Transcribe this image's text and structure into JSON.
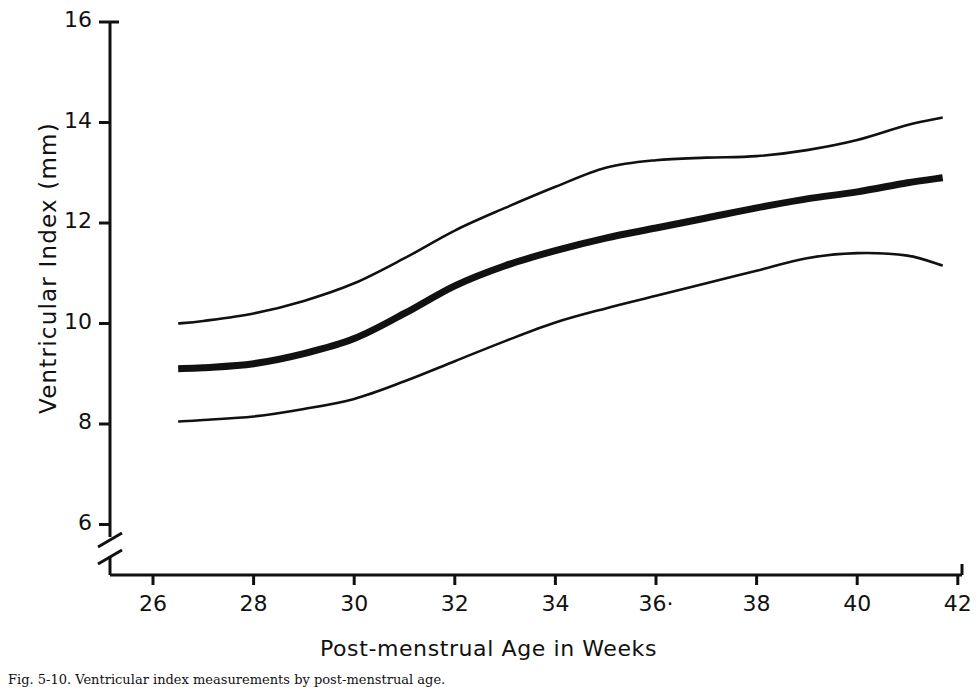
{
  "figure": {
    "caption": "Fig. 5-10.  Ventricular index measurements by post-menstrual age."
  },
  "chart_data": {
    "type": "line",
    "title": "",
    "xlabel": "Post-menstrual Age in Weeks",
    "ylabel": "Ventricular Index (mm)",
    "xlim": [
      25,
      42
    ],
    "ylim": [
      5.2,
      16
    ],
    "grid": false,
    "legend": "none",
    "axis_break": {
      "axis": "y",
      "below": 6,
      "symbol": "double-slash"
    },
    "xticks": [
      26,
      28,
      30,
      32,
      34,
      36,
      38,
      40,
      42
    ],
    "xtick_labels": [
      "26",
      "28",
      "30",
      "32",
      "34",
      "36·",
      "38",
      "40",
      "42"
    ],
    "yticks": [
      6,
      8,
      10,
      12,
      14,
      16
    ],
    "ytick_labels": [
      "6",
      "8",
      "10",
      "12",
      "14",
      "16"
    ],
    "x": [
      26.5,
      27,
      28,
      29,
      30,
      31,
      32,
      33,
      34,
      35,
      36,
      37,
      38,
      39,
      40,
      41,
      41.7
    ],
    "series": [
      {
        "name": "Upper limit (97th percentile)",
        "style": "thin",
        "values": [
          10.0,
          10.05,
          10.2,
          10.45,
          10.8,
          11.3,
          11.85,
          12.3,
          12.72,
          13.1,
          13.25,
          13.3,
          13.33,
          13.45,
          13.65,
          13.95,
          14.1
        ]
      },
      {
        "name": "Mean ventricular index",
        "style": "thick",
        "values": [
          9.1,
          9.12,
          9.2,
          9.4,
          9.7,
          10.2,
          10.75,
          11.15,
          11.45,
          11.7,
          11.9,
          12.1,
          12.3,
          12.48,
          12.62,
          12.8,
          12.9
        ]
      },
      {
        "name": "Lower limit (3rd percentile)",
        "style": "thin",
        "values": [
          8.05,
          8.08,
          8.15,
          8.3,
          8.5,
          8.85,
          9.25,
          9.65,
          10.02,
          10.3,
          10.55,
          10.8,
          11.05,
          11.3,
          11.4,
          11.35,
          11.15
        ]
      }
    ]
  },
  "axes": {
    "line_color": "#111111",
    "tick_len": 10
  }
}
